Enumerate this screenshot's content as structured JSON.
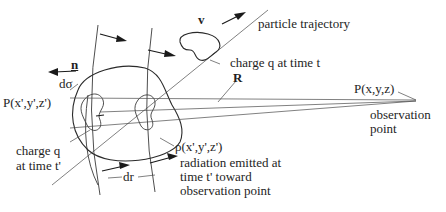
{
  "labels": {
    "velocity": "v",
    "trajectory": "particle trajectory",
    "charge_t": "charge q at time t",
    "normal": "n",
    "area": "dσ",
    "source_point": "P(x',y',z')",
    "R_vector": "R",
    "observer": "P(x,y,z)",
    "observation_line1": "observation",
    "observation_line2": "point",
    "charge_tprime_line1": "charge q",
    "charge_tprime_line2": "at time t'",
    "density": "ρ(x',y',z')",
    "radiation_line1": "radiation emitted at",
    "radiation_line2": "time t' toward",
    "radiation_line3": "observation point",
    "shell_thickness": "dr"
  },
  "colors": {
    "ink": "#1e1e1e",
    "background": "#ffffff"
  }
}
